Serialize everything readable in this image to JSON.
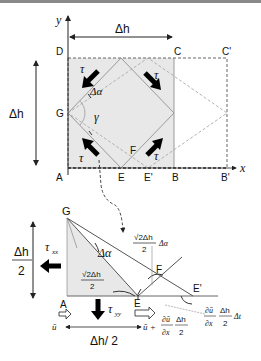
{
  "top_diagram": {
    "axes": {
      "x_label": "x",
      "y_label": "y"
    },
    "width_dimension": "Δh",
    "height_dimension": "Δh",
    "points": {
      "A": "A",
      "B": "B",
      "B_prime": "B'",
      "C": "C",
      "C_prime": "C'",
      "D": "D",
      "E": "E",
      "E_prime": "E'",
      "F": "F",
      "G": "G"
    },
    "angle_delta_alpha": "Δα",
    "angle_gamma": "γ",
    "shear_stress": "τ",
    "colors": {
      "shaded": "#e8e8e8",
      "lines": "#9a9a9a",
      "arrows": "#000000"
    }
  },
  "bottom_diagram": {
    "points": {
      "G": "G",
      "A": "A",
      "E": "E",
      "E_prime": "E'",
      "F": "F"
    },
    "height_dimension": {
      "numerator": "Δh",
      "denominator": "2"
    },
    "base_dimension": "Δh/ 2",
    "stress_xx": {
      "symbol": "τ",
      "subscript": "xx"
    },
    "stress_yy": {
      "symbol": "τ",
      "subscript": "yy"
    },
    "angle_delta_alpha": "Δα",
    "hypotenuse_label": {
      "numerator": "√2Δh",
      "denominator": "2"
    },
    "arc_label": {
      "numerator": "√2Δh",
      "denominator": "2",
      "suffix": "Δα"
    },
    "velocity_left": "ū",
    "velocity_right": {
      "prefix": "ū +",
      "frac1": {
        "numerator": "∂ū",
        "denominator": "∂x"
      },
      "frac2": {
        "numerator": "Δh",
        "denominator": "2"
      }
    },
    "displacement": {
      "frac1": {
        "numerator": "∂ū",
        "denominator": "∂x"
      },
      "frac2": {
        "numerator": "Δh",
        "denominator": "2"
      },
      "suffix": "Δt"
    }
  }
}
